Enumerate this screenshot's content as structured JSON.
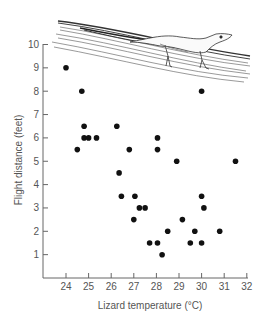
{
  "chart_data": {
    "type": "scatter",
    "title": "",
    "xlabel": "Lizard temperature  (°C)",
    "ylabel": "Flight distance (feet)",
    "xlim": [
      23,
      32
    ],
    "ylim": [
      0,
      10
    ],
    "x_ticks": [
      24,
      25,
      26,
      27,
      28,
      29,
      30,
      31,
      32
    ],
    "y_ticks": [
      1,
      2,
      3,
      4,
      5,
      6,
      7,
      8,
      9,
      10
    ],
    "grid": false,
    "legend": null,
    "annotations": [
      "illustration of a lizard on a branch at top of plot"
    ],
    "series": [
      {
        "name": "observations",
        "color": "#111111",
        "points": [
          {
            "x": 24.0,
            "y": 9.0
          },
          {
            "x": 24.7,
            "y": 8.0
          },
          {
            "x": 24.5,
            "y": 5.5
          },
          {
            "x": 24.8,
            "y": 6.5
          },
          {
            "x": 24.8,
            "y": 6.0
          },
          {
            "x": 25.0,
            "y": 6.0
          },
          {
            "x": 25.35,
            "y": 6.0
          },
          {
            "x": 26.25,
            "y": 6.5
          },
          {
            "x": 26.35,
            "y": 4.5
          },
          {
            "x": 26.45,
            "y": 3.5
          },
          {
            "x": 26.8,
            "y": 5.5
          },
          {
            "x": 27.05,
            "y": 3.5
          },
          {
            "x": 27.0,
            "y": 2.5
          },
          {
            "x": 27.25,
            "y": 3.0
          },
          {
            "x": 27.5,
            "y": 3.0
          },
          {
            "x": 27.7,
            "y": 1.5
          },
          {
            "x": 28.05,
            "y": 1.5
          },
          {
            "x": 28.05,
            "y": 6.0
          },
          {
            "x": 28.05,
            "y": 5.5
          },
          {
            "x": 28.25,
            "y": 1.0
          },
          {
            "x": 28.5,
            "y": 2.0
          },
          {
            "x": 28.9,
            "y": 5.0
          },
          {
            "x": 29.15,
            "y": 2.5
          },
          {
            "x": 29.5,
            "y": 1.5
          },
          {
            "x": 29.7,
            "y": 2.0
          },
          {
            "x": 30.0,
            "y": 3.5
          },
          {
            "x": 30.1,
            "y": 3.0
          },
          {
            "x": 30.0,
            "y": 1.5
          },
          {
            "x": 30.0,
            "y": 8.0
          },
          {
            "x": 30.8,
            "y": 2.0
          },
          {
            "x": 31.5,
            "y": 5.0
          }
        ]
      }
    ]
  },
  "labels": {
    "x_axis_title": "Lizard temperature  (°C)",
    "y_axis_title": "Flight distance (feet)"
  }
}
